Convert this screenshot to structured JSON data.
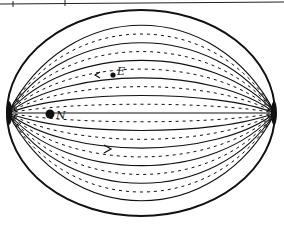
{
  "diagram": {
    "type": "field-lines",
    "colors": {
      "ink": "#111111",
      "background": "#ffffff"
    },
    "boundary": {
      "shape": "ellipse",
      "cx": 141,
      "cy": 113,
      "rx": 134,
      "ry": 103
    },
    "poles": [
      {
        "name": "left-pole",
        "x": 8,
        "y": 113
      },
      {
        "name": "right-pole",
        "x": 275,
        "y": 113
      }
    ],
    "labels": {
      "E": "E",
      "N": "N"
    },
    "points": [
      {
        "label": "E",
        "x": 113,
        "y": 75,
        "marker": "small-dot"
      },
      {
        "label": "N",
        "x": 50,
        "y": 114,
        "marker": "large-dot"
      }
    ],
    "arrows": [
      {
        "x": 98,
        "y": 75,
        "direction": "left"
      },
      {
        "x": 108,
        "y": 149,
        "direction": "right"
      }
    ],
    "line_count": 22
  }
}
